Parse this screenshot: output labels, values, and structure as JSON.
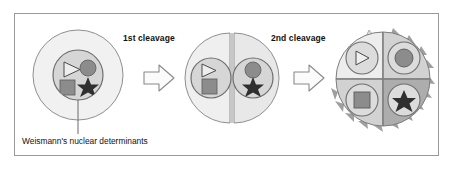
{
  "figure": {
    "background": "#ffffff",
    "border_color": "#9a9a9a"
  },
  "palette": {
    "cytoplasm_light": "#f1f1f1",
    "cytoplasm_mid": "#e4e4e4",
    "cytoplasm_dark": "#c9c9c9",
    "cytoplasm_darker": "#b3b3b3",
    "nucleus_fill": "#d6d6d6",
    "nucleus_stroke": "#6e6e6e",
    "outline": "#7a7a7a",
    "shape_fill": "#8c8c8c",
    "shape_dark": "#3b3b3b",
    "text": "#111111",
    "arrow_fill": "#fbfbfb",
    "arrow_stroke": "#8a8a8a"
  },
  "labels": {
    "first_cleavage": "1st cleavage",
    "second_cleavage": "2nd cleavage",
    "determinants_caption": "Weismann's nuclear determinants"
  },
  "determinants": [
    {
      "id": "triangle",
      "name": "triangle-determinant",
      "style": "outlined"
    },
    {
      "id": "circle",
      "name": "circle-determinant",
      "style": "filled"
    },
    {
      "id": "square",
      "name": "square-determinant",
      "style": "filled"
    },
    {
      "id": "star",
      "name": "star-determinant",
      "style": "filled-dark"
    }
  ],
  "stages": [
    {
      "id": "zygote",
      "name": "one-cell-stage",
      "cell_count": 1,
      "contents": [
        "triangle",
        "circle",
        "square",
        "star"
      ],
      "annotated": true
    },
    {
      "id": "two-cell",
      "name": "two-cell-stage",
      "cell_count": 2,
      "cells": [
        {
          "position": "left",
          "contents": [
            "triangle",
            "square"
          ]
        },
        {
          "position": "right",
          "contents": [
            "circle",
            "star"
          ]
        }
      ]
    },
    {
      "id": "four-cell",
      "name": "four-cell-stage",
      "cell_count": 4,
      "spiky": true,
      "cells": [
        {
          "position": "top-left",
          "contents": [
            "triangle"
          ],
          "shade": "#ededed"
        },
        {
          "position": "top-right",
          "contents": [
            "circle"
          ],
          "shade": "#d2d2d2"
        },
        {
          "position": "bottom-left",
          "contents": [
            "square"
          ],
          "shade": "#d2d2d2"
        },
        {
          "position": "bottom-right",
          "contents": [
            "star"
          ],
          "shade": "#adadad"
        }
      ]
    }
  ],
  "arrows": [
    {
      "id": "arrow1",
      "name": "transition-arrow-first-cleavage",
      "direction": "right"
    },
    {
      "id": "arrow2",
      "name": "transition-arrow-second-cleavage",
      "direction": "right"
    }
  ]
}
